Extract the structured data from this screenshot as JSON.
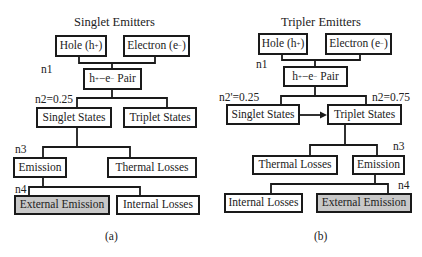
{
  "panels": {
    "a": {
      "title": "Singlet Emitters",
      "caption": "(a)",
      "nodes": {
        "hole": {
          "label": "Hole (h",
          "sup": "+",
          "close": ")"
        },
        "electron": {
          "label": "Electron (e",
          "sup": "−",
          "close": ")"
        },
        "pair": {
          "pre": "h",
          "sup1": "+",
          "mid": "−e",
          "sup2": "−",
          "post": " Pair"
        },
        "singlet": "Singlet States",
        "triplet": "Triplet States",
        "emission": "Emission",
        "thermal": "Thermal Losses",
        "external": "External Emission",
        "internal": "Internal Losses"
      },
      "labels": {
        "n1": "n1",
        "n2": "n2=0.25",
        "n3": "n3",
        "n4": "n4"
      }
    },
    "b": {
      "title": "Tripler Emitters",
      "caption": "(b)",
      "nodes": {
        "hole": {
          "label": "Hole (h",
          "sup": "+",
          "close": ")"
        },
        "electron": {
          "label": "Electron (e",
          "sup": "−",
          "close": ")"
        },
        "pair": {
          "pre": "h",
          "sup1": "+",
          "mid": "−e",
          "sup2": "−",
          "post": " Pair"
        },
        "singlet": "Singlet States",
        "triplet": "Triplet States",
        "thermal": "Thermal Losses",
        "emission": "Emission",
        "internal": "Internal Losses",
        "external": "External Emission"
      },
      "labels": {
        "n1": "n1",
        "n2prime": "n2'=0.25",
        "n2": "n2=0.75",
        "n3": "n3",
        "n4": "n4"
      }
    }
  },
  "colors": {
    "line": "#1a1a1a",
    "shaded_box": "#c8c8c8"
  }
}
